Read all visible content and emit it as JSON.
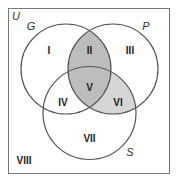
{
  "universe": {
    "label": "U"
  },
  "sets": [
    {
      "id": "G",
      "label": "G",
      "cx": 66,
      "cy": 69,
      "r": 45
    },
    {
      "id": "P",
      "label": "P",
      "cx": 113,
      "cy": 69,
      "r": 45
    },
    {
      "id": "S",
      "label": "S",
      "cx": 89.5,
      "cy": 113,
      "r": 46.5
    }
  ],
  "regions": [
    {
      "id": "I",
      "label": "I",
      "shaded": false
    },
    {
      "id": "II",
      "label": "II",
      "shaded": true
    },
    {
      "id": "III",
      "label": "III",
      "shaded": false
    },
    {
      "id": "IV",
      "label": "IV",
      "shaded": false
    },
    {
      "id": "V",
      "label": "V",
      "shaded": true
    },
    {
      "id": "VI",
      "label": "VI",
      "shaded": true
    },
    {
      "id": "VII",
      "label": "VII",
      "shaded": false
    },
    {
      "id": "VIII",
      "label": "VIII",
      "shaded": false
    }
  ],
  "colors": {
    "outline": "#555555",
    "shade_dark": "#bdbdbd",
    "shade_light": "#d6d6d6",
    "background": "#ffffff"
  }
}
